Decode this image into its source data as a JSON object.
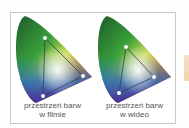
{
  "panels": [
    {
      "caption_line1": "przestrzeń barw",
      "caption_line2": "w filmie",
      "triangle": [
        [
          34,
          25
        ],
        [
          72,
          63
        ],
        [
          32,
          83
        ]
      ]
    },
    {
      "caption_line1": "przestrzeń barw",
      "caption_line2": "w wideo",
      "triangle": [
        [
          33,
          34
        ],
        [
          61,
          64
        ],
        [
          26,
          80
        ]
      ]
    }
  ],
  "colors": {
    "frame_border": "#c9c9c9",
    "caption_text": "#555555",
    "triangle_line": "#3a3a5a",
    "vertex_dot": "#ffffff"
  }
}
